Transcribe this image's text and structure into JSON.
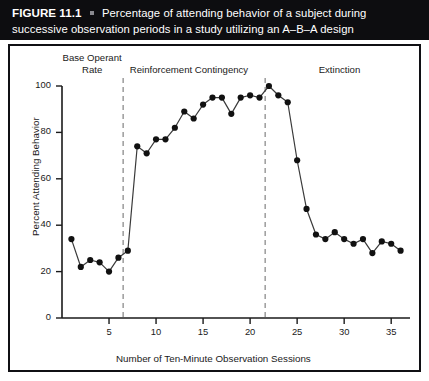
{
  "caption": {
    "figure_number": "FIGURE 11.1",
    "bullet": "square-bullet",
    "line1": "Percentage of attending behavior of a subject during",
    "line2": "successive observation periods in a study utilizing an A–B–A design"
  },
  "colors": {
    "header_background": "#0d0d10",
    "header_text": "#ffffff",
    "panel_border": "#101014",
    "panel_background": "#ffffff",
    "axis": "#1a1a1a",
    "line": "#3a3a3a",
    "marker": "#111111",
    "phase_divider": "#8c8c8c"
  },
  "chart_data": {
    "type": "line",
    "title": "",
    "xlabel": "Number of Ten-Minute Observation Sessions",
    "ylabel": "Percent Attending Behavior",
    "xlim": [
      0,
      37
    ],
    "ylim": [
      0,
      100
    ],
    "xticks": [
      5,
      10,
      15,
      20,
      25,
      30,
      35
    ],
    "yticks": [
      0,
      20,
      40,
      60,
      80,
      100
    ],
    "xtick_labels": [
      "5",
      "10",
      "15",
      "20",
      "25",
      "30",
      "35"
    ],
    "ytick_labels": [
      "0",
      "20",
      "40",
      "60",
      "80",
      "100"
    ],
    "grid": false,
    "legend": false,
    "markers": "filled-circle",
    "x": [
      1,
      2,
      3,
      4,
      5,
      6,
      7,
      8,
      9,
      10,
      11,
      12,
      13,
      14,
      15,
      16,
      17,
      18,
      19,
      20,
      21,
      22,
      23,
      24,
      25,
      26,
      27,
      28,
      29,
      30,
      31,
      32,
      33,
      34,
      35,
      36
    ],
    "values": [
      34,
      22,
      25,
      24,
      20,
      26,
      29,
      74,
      71,
      77,
      77,
      82,
      89,
      86,
      92,
      95,
      95,
      88,
      95,
      96,
      95,
      100,
      96,
      93,
      68,
      47,
      36,
      34,
      37,
      34,
      32,
      34,
      28,
      33,
      32,
      29
    ],
    "series": [
      {
        "name": "Percent attending behavior",
        "values": [
          34,
          22,
          25,
          24,
          20,
          26,
          29,
          74,
          71,
          77,
          77,
          82,
          89,
          86,
          92,
          95,
          95,
          88,
          95,
          96,
          95,
          100,
          96,
          93,
          68,
          47,
          36,
          34,
          37,
          34,
          32,
          34,
          28,
          33,
          32,
          29
        ]
      }
    ],
    "phase_dividers": [
      6.5,
      21.6
    ],
    "annotations": [
      {
        "text": "Base Operant",
        "text2": "Rate",
        "x": 3.2,
        "y": 112
      },
      {
        "text": "Reinforcement Contingency",
        "text2": "",
        "x": 13.5,
        "y": 107
      },
      {
        "text": "Extinction",
        "text2": "",
        "x": 29.5,
        "y": 107
      }
    ]
  }
}
